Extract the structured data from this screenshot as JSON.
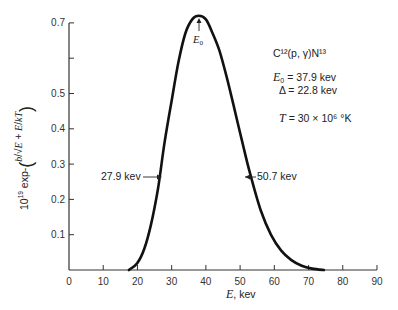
{
  "chart_data": {
    "type": "line",
    "title": "",
    "xlabel": "E, kev",
    "ylabel": "10^19 exp-(b/√E + E/kT)",
    "xlim": [
      0,
      90
    ],
    "ylim": [
      0,
      0.7
    ],
    "grid": false,
    "x_ticks": [
      0,
      10,
      20,
      30,
      40,
      50,
      60,
      70,
      80,
      90
    ],
    "y_ticks": [
      0.1,
      0.2,
      0.3,
      0.4,
      0.5,
      0.6,
      0.7
    ],
    "y_tick_labels": [
      "0.1",
      "0.2",
      "0.3",
      "0.4",
      "0.5",
      "",
      "0.7"
    ],
    "series": [
      {
        "name": "C12(p,γ)N13 Gamow peak",
        "x": [
          17.5,
          20,
          22,
          24,
          26,
          27.9,
          30,
          32,
          34,
          36,
          37.9,
          40,
          42,
          44,
          46,
          48,
          50.7,
          53,
          56,
          59,
          62,
          65,
          68,
          71,
          74.5
        ],
        "y": [
          0.0,
          0.02,
          0.06,
          0.13,
          0.23,
          0.36,
          0.48,
          0.59,
          0.67,
          0.71,
          0.72,
          0.71,
          0.67,
          0.62,
          0.55,
          0.47,
          0.36,
          0.27,
          0.17,
          0.1,
          0.055,
          0.028,
          0.012,
          0.004,
          0.0
        ]
      }
    ],
    "annotations": [
      {
        "text": "E₀",
        "x": 37.9,
        "y": 0.72
      },
      {
        "text": "27.9 kev",
        "x": 27.9,
        "y": 0.36
      },
      {
        "text": "50.7 kev",
        "x": 50.7,
        "y": 0.36
      }
    ],
    "legend": {
      "reaction": "C¹²(p, γ)N¹³",
      "e0": "= 37.9 kev",
      "delta": "Δ = 22.8 kev",
      "temp": "= 30 × 10⁶ °K"
    }
  },
  "labels": {
    "xlabel_var": "E",
    "xlabel_unit": ", kev",
    "e0_var": "E",
    "e0_sub": "0",
    "left_half": "27.9 kev",
    "right_half": "50.7 kev",
    "t_var": "T"
  }
}
